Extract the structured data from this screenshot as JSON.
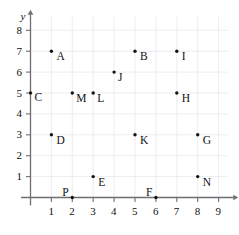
{
  "chart_data": {
    "type": "scatter",
    "title": "",
    "xlabel": "x",
    "ylabel": "y",
    "xlim": [
      0,
      9.6
    ],
    "ylim": [
      0,
      8.6
    ],
    "grid": true,
    "legend": false,
    "x_ticks": [
      "1",
      "2",
      "3",
      "4",
      "5",
      "6",
      "7",
      "8",
      "9"
    ],
    "y_ticks": [
      "1",
      "2",
      "3",
      "4",
      "5",
      "6",
      "7",
      "8"
    ],
    "x_tick_values": [
      1,
      2,
      3,
      4,
      5,
      6,
      7,
      8,
      9
    ],
    "y_tick_values": [
      1,
      2,
      3,
      4,
      5,
      6,
      7,
      8
    ],
    "point_color": "#141414",
    "axis_color": "#6e6e74",
    "grid_color": "#e9e9ec",
    "points": [
      {
        "label": "A",
        "x": 1,
        "y": 7,
        "label_dx": 5,
        "label_dy": 9
      },
      {
        "label": "B",
        "x": 5,
        "y": 7,
        "label_dx": 5,
        "label_dy": 9
      },
      {
        "label": "C",
        "x": 0,
        "y": 5,
        "label_dx": 4,
        "label_dy": 8
      },
      {
        "label": "D",
        "x": 1,
        "y": 3,
        "label_dx": 5,
        "label_dy": 9
      },
      {
        "label": "E",
        "x": 3,
        "y": 1,
        "label_dx": 5,
        "label_dy": 9
      },
      {
        "label": "F",
        "x": 6,
        "y": 0,
        "label_dx": -10,
        "label_dy": -2
      },
      {
        "label": "G",
        "x": 8,
        "y": 3,
        "label_dx": 5,
        "label_dy": 9
      },
      {
        "label": "H",
        "x": 7,
        "y": 5,
        "label_dx": 5,
        "label_dy": 9
      },
      {
        "label": "I",
        "x": 7,
        "y": 7,
        "label_dx": 5,
        "label_dy": 9
      },
      {
        "label": "J",
        "x": 4,
        "y": 6,
        "label_dx": 4,
        "label_dy": 9
      },
      {
        "label": "K",
        "x": 5,
        "y": 3,
        "label_dx": 5,
        "label_dy": 9
      },
      {
        "label": "L",
        "x": 3,
        "y": 5,
        "label_dx": 4,
        "label_dy": 9
      },
      {
        "label": "M",
        "x": 2,
        "y": 5,
        "label_dx": 4,
        "label_dy": 9
      },
      {
        "label": "N",
        "x": 8,
        "y": 1,
        "label_dx": 5,
        "label_dy": 9
      },
      {
        "label": "P",
        "x": 2,
        "y": 0,
        "label_dx": -10,
        "label_dy": -2
      }
    ]
  }
}
